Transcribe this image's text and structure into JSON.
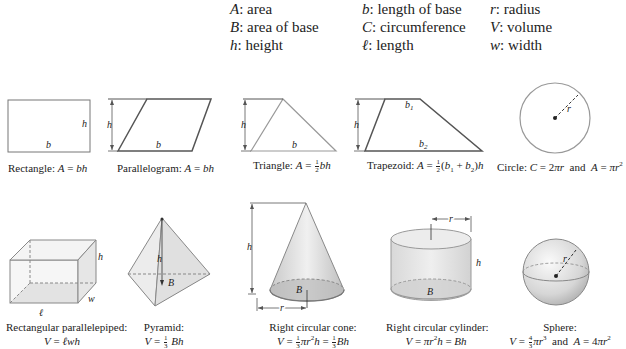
{
  "legend": {
    "columns": [
      [
        {
          "symbol": "A",
          "meaning": "area"
        },
        {
          "symbol": "B",
          "meaning": "area of base"
        },
        {
          "symbol": "h",
          "meaning": "height"
        }
      ],
      [
        {
          "symbol": "b",
          "meaning": "length of base"
        },
        {
          "symbol": "C",
          "meaning": "circumference"
        },
        {
          "symbol": "ℓ",
          "meaning": "length"
        }
      ],
      [
        {
          "symbol": "r",
          "meaning": "radius"
        },
        {
          "symbol": "V",
          "meaning": "volume"
        },
        {
          "symbol": "w",
          "meaning": "width"
        }
      ]
    ]
  },
  "shapes2d": [
    {
      "name": "Rectangle",
      "formula": "A = bh",
      "labels": [
        "b",
        "h"
      ]
    },
    {
      "name": "Parallelogram",
      "formula": "A = bh",
      "labels": [
        "b",
        "h"
      ]
    },
    {
      "name": "Triangle",
      "formula": "A = ½bh",
      "labels": [
        "b",
        "h"
      ]
    },
    {
      "name": "Trapezoid",
      "formula": "A = ½(b₁ + b₂)h",
      "labels": [
        "b1",
        "b2",
        "h"
      ]
    },
    {
      "name": "Circle",
      "formula": "C = 2πr and A = πr²",
      "labels": [
        "r"
      ]
    }
  ],
  "shapes3d": [
    {
      "name": "Rectangular parallelepiped",
      "formula": "V = ℓwh",
      "labels": [
        "h",
        "w",
        "ℓ"
      ]
    },
    {
      "name": "Pyramid",
      "formula": "V = ⅓Bh",
      "labels": [
        "h",
        "B"
      ]
    },
    {
      "name": "Right circular cone",
      "formula": "V = ⅓πr²h = ⅓Bh",
      "labels": [
        "h",
        "B",
        "r"
      ]
    },
    {
      "name": "Right circular cylinder",
      "formula": "V = πr²h = Bh",
      "labels": [
        "r",
        "h",
        "B"
      ]
    },
    {
      "name": "Sphere",
      "formula": "V = 4⁄3πr³ and A = 4πr²",
      "labels": [
        "r"
      ]
    }
  ],
  "text": {
    "cap_rect": "Rectangle:",
    "cap_para": "Parallelogram:",
    "cap_tri": "Triangle:",
    "cap_trap": "Trapezoid:",
    "cap_circle": "Circle:",
    "cap_box": "Rectangular parallelepiped:",
    "cap_pyr": "Pyramid:",
    "cap_cone": "Right circular cone:",
    "cap_cyl": "Right circular cylinder:",
    "cap_sphere": "Sphere:"
  }
}
